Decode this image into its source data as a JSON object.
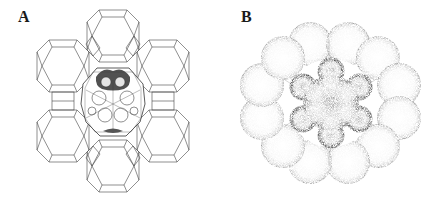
{
  "figure": {
    "panels": [
      {
        "id": "A",
        "label": "A",
        "description": "Wireframe of zeolite framework: six cages arranged hexagonally around a central supercage containing a guest cluster"
      },
      {
        "id": "B",
        "label": "B",
        "description": "Stippled space-filling view: twelve spheres in a ring surrounding a central six-lobed cluster"
      }
    ],
    "colors": {
      "line": "#3a3a3a",
      "stipple": "#222222",
      "background": "#ffffff"
    }
  }
}
